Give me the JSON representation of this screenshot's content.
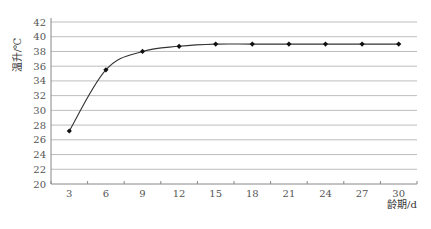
{
  "chart_data": {
    "type": "line",
    "title": "",
    "xlabel": "龄期/d",
    "ylabel": "温升/℃",
    "x": [
      3,
      6,
      9,
      12,
      15,
      18,
      21,
      24,
      27,
      30
    ],
    "categories": [
      "3",
      "6",
      "9",
      "12",
      "15",
      "18",
      "21",
      "24",
      "27",
      "30"
    ],
    "series": [
      {
        "name": "温升",
        "values": [
          27.2,
          35.5,
          38.0,
          38.7,
          39.0,
          39.0,
          39.0,
          39.0,
          39.0,
          39.0
        ]
      }
    ],
    "yticks": [
      20,
      22,
      24,
      26,
      28,
      30,
      32,
      34,
      36,
      38,
      40,
      42
    ],
    "ylim": [
      20,
      42
    ],
    "grid": true,
    "legend": "none",
    "colors": {
      "line": "#333333",
      "marker": "#111111",
      "grid": "#bdbdbd",
      "axis": "#888888"
    }
  }
}
